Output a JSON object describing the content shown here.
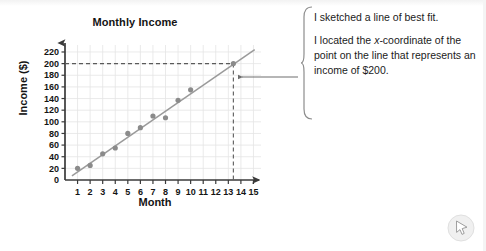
{
  "chart_data": {
    "type": "scatter",
    "title": "Monthly Income",
    "xlabel": "Month",
    "ylabel": "Income ($)",
    "xlim": [
      0,
      15.6
    ],
    "ylim": [
      0,
      232
    ],
    "grid": true,
    "legend": "none",
    "x": [
      1,
      2,
      3,
      4,
      5,
      6,
      7,
      8,
      9,
      10
    ],
    "values": [
      20,
      25,
      45,
      55,
      80,
      90,
      110,
      107,
      137,
      155
    ],
    "xticks": [
      "1",
      "2",
      "3",
      "4",
      "5",
      "6",
      "7",
      "8",
      "9",
      "10",
      "11",
      "12",
      "13",
      "14",
      "15"
    ],
    "yticks": [
      "0",
      "20",
      "40",
      "60",
      "80",
      "100",
      "120",
      "140",
      "160",
      "180",
      "200",
      "220"
    ],
    "series": [
      {
        "name": "Monthly income data points",
        "type": "scatter",
        "x": [
          1,
          2,
          3,
          4,
          5,
          6,
          7,
          8,
          9,
          10
        ],
        "values": [
          20,
          25,
          45,
          55,
          80,
          90,
          110,
          107,
          137,
          155
        ]
      },
      {
        "name": "Line of best fit",
        "type": "line",
        "x": [
          0.55,
          15.1
        ],
        "values": [
          7,
          224
        ]
      }
    ],
    "annotations": [
      {
        "name": "income-reference-line",
        "type": "horizontal-dashed",
        "y": 200,
        "label": "200"
      },
      {
        "name": "month-reference-line",
        "type": "vertical-dashed",
        "x": 13.4,
        "label": "13.4"
      },
      {
        "name": "intersection-point",
        "type": "point",
        "x": 13.4,
        "y": 200
      }
    ]
  },
  "annotation": {
    "line1": "I sketched a line of best fit.",
    "line2_pre": "I located the ",
    "line2_italic": "x",
    "line2_post": "-coordinate of the point on the line that represents an income of $200."
  },
  "colors": {
    "axis": "#3a3a3a",
    "grid": "#e4e4e4",
    "point": "#8b8b8b",
    "fit_line": "#9a9a9a",
    "dashed": "#5a5a5a",
    "text": "#141414"
  },
  "icons": {
    "cursor": "cursor-arrow-icon",
    "connector": "left-arrow-icon",
    "brace": "curly-brace-icon"
  }
}
